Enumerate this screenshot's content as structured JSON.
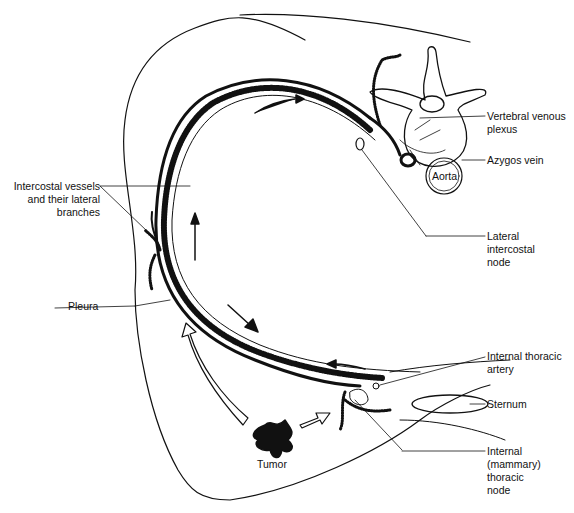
{
  "figure": {
    "colors": {
      "ink": "#111111",
      "background": "#ffffff"
    }
  },
  "labels": {
    "intercostal_vessels": [
      "Intercostal vessels",
      "and their lateral",
      "branches"
    ],
    "pleura": "Pleura",
    "vertebral_venous_plexus": [
      "Vertebral venous",
      "plexus"
    ],
    "azygos_vein": "Azygos vein",
    "aorta": "Aorta",
    "lateral_intercostal_node": [
      "Lateral",
      "intercostal",
      "node"
    ],
    "internal_thoracic_artery": [
      "Internal thoracic",
      "artery"
    ],
    "sternum": "Sternum",
    "internal_mammary_node": [
      "Internal",
      "(mammary)",
      "thoracic",
      "node"
    ],
    "tumor": "Tumor"
  },
  "arrows": [
    {
      "name": "flow-arrow-top",
      "direction": "clockwise-right"
    },
    {
      "name": "flow-arrow-left",
      "direction": "up"
    },
    {
      "name": "flow-arrow-lower",
      "direction": "down-right"
    },
    {
      "name": "flow-arrow-anterior",
      "direction": "left"
    },
    {
      "name": "tumor-arrow-lateral",
      "style": "hollow",
      "direction": "up-left"
    },
    {
      "name": "tumor-arrow-medial",
      "style": "hollow",
      "direction": "right"
    }
  ]
}
